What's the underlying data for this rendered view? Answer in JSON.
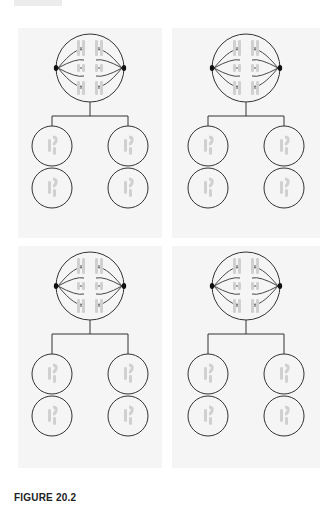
{
  "figure": {
    "caption": "FIGURE 20.2",
    "colors": {
      "background": "#ffffff",
      "panel": "#f5f5f5",
      "outline": "#333333",
      "chromosome": "#d0d0d0",
      "centrosome": "#111111"
    },
    "panels": [
      {
        "id": "panel-1",
        "position": "top-left",
        "parent_cell": "metaphase-spindle",
        "daughter_cells": 4
      },
      {
        "id": "panel-2",
        "position": "top-right",
        "parent_cell": "metaphase-spindle",
        "daughter_cells": 4
      },
      {
        "id": "panel-3",
        "position": "bottom-left",
        "parent_cell": "metaphase-spindle",
        "daughter_cells": 4
      },
      {
        "id": "panel-4",
        "position": "bottom-right",
        "parent_cell": "metaphase-spindle",
        "daughter_cells": 4
      }
    ]
  }
}
